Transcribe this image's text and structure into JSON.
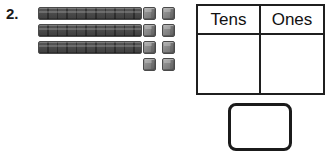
{
  "problem": {
    "number_label": "2.",
    "instructions_visible": false
  },
  "manipulatives": {
    "type": "base-ten-blocks",
    "tens_rods": {
      "count": 3,
      "units_per_rod": 10,
      "icon": "ten-rod-icon",
      "color": "#8a8a8a"
    },
    "ones_cubes": {
      "count": 8,
      "columns": 2,
      "rows": 4,
      "icon": "unit-cube-icon",
      "color": "#8a8a8a"
    },
    "represented_value": 38
  },
  "place_value_table": {
    "headers": [
      "Tens",
      "Ones"
    ],
    "rows": [
      {
        "tens": "",
        "ones": ""
      }
    ]
  },
  "answer_box": {
    "value": "",
    "shape": "rounded-rectangle"
  },
  "colors": {
    "ink": "#1b1b1b",
    "block_gray": "#8a8a8a",
    "block_outline": "#4a4a4a",
    "page_background": "#ffffff"
  }
}
